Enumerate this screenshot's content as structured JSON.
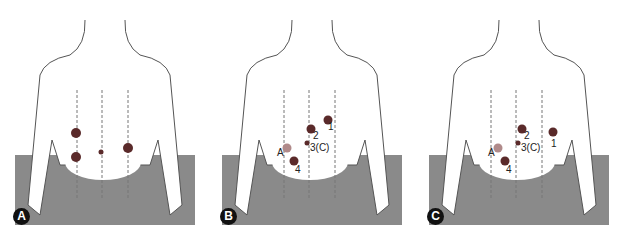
{
  "figure": {
    "panels": [
      {
        "id": "A",
        "badge": "A",
        "labels": []
      },
      {
        "id": "B",
        "badge": "B",
        "labels": [
          {
            "text": "1",
            "x": 64,
            "y": 122
          },
          {
            "text": "2",
            "x": 50,
            "y": 132
          },
          {
            "text": "3(C)",
            "x": 51,
            "y": 145
          },
          {
            "text": "A",
            "x": 20,
            "y": 149
          },
          {
            "text": "4",
            "x": 36,
            "y": 168
          }
        ]
      },
      {
        "id": "C",
        "badge": "C",
        "labels": [
          {
            "text": "2",
            "x": 52,
            "y": 132
          },
          {
            "text": "1",
            "x": 82,
            "y": 141
          },
          {
            "text": "3(C)",
            "x": 52,
            "y": 145
          },
          {
            "text": "A",
            "x": 22,
            "y": 149
          },
          {
            "text": "4",
            "x": 38,
            "y": 168
          }
        ]
      }
    ],
    "colors": {
      "port": "#5a2a2a",
      "assist_port": "#b08a8a",
      "drape": "#7a7a7a",
      "outline": "#555555"
    }
  }
}
